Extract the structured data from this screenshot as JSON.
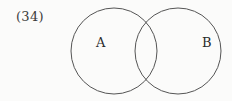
{
  "problem": {
    "number_label": "(34)"
  },
  "diagram": {
    "type": "venn",
    "stroke_color": "#555555",
    "background_color": "#fbfbfa",
    "sets": [
      {
        "label": "A",
        "cx": 114,
        "cy": 51,
        "r": 43
      },
      {
        "label": "B",
        "cx": 178,
        "cy": 51,
        "r": 43
      }
    ]
  }
}
